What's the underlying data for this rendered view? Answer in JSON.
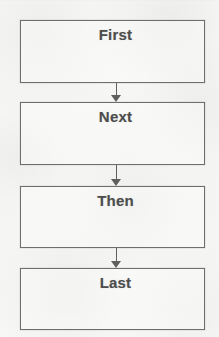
{
  "diagram": {
    "type": "flowchart",
    "orientation": "vertical",
    "background_color": "#f6f6f4",
    "box_border_color": "#6e6e6e",
    "text_color": "#4d4d4d",
    "arrow_color": "#5f5f5f",
    "nodes": [
      {
        "id": "node-1",
        "label": "First",
        "x": 20,
        "y": 20,
        "width": 185,
        "height": 63
      },
      {
        "id": "node-2",
        "label": "Next",
        "x": 20,
        "y": 102,
        "width": 185,
        "height": 63
      },
      {
        "id": "node-3",
        "label": "Then",
        "x": 20,
        "y": 186,
        "width": 185,
        "height": 62
      },
      {
        "id": "node-4",
        "label": "Last",
        "x": 20,
        "y": 268,
        "width": 185,
        "height": 62
      }
    ],
    "connectors": [
      {
        "id": "arrow-1",
        "from": "node-1",
        "to": "node-2",
        "x": 111,
        "y": 83,
        "length": 19,
        "direction": "down"
      },
      {
        "id": "arrow-2",
        "from": "node-2",
        "to": "node-3",
        "x": 111,
        "y": 165,
        "length": 21,
        "direction": "down"
      },
      {
        "id": "arrow-3",
        "from": "node-3",
        "to": "node-4",
        "x": 111,
        "y": 248,
        "length": 20,
        "direction": "down"
      }
    ]
  }
}
